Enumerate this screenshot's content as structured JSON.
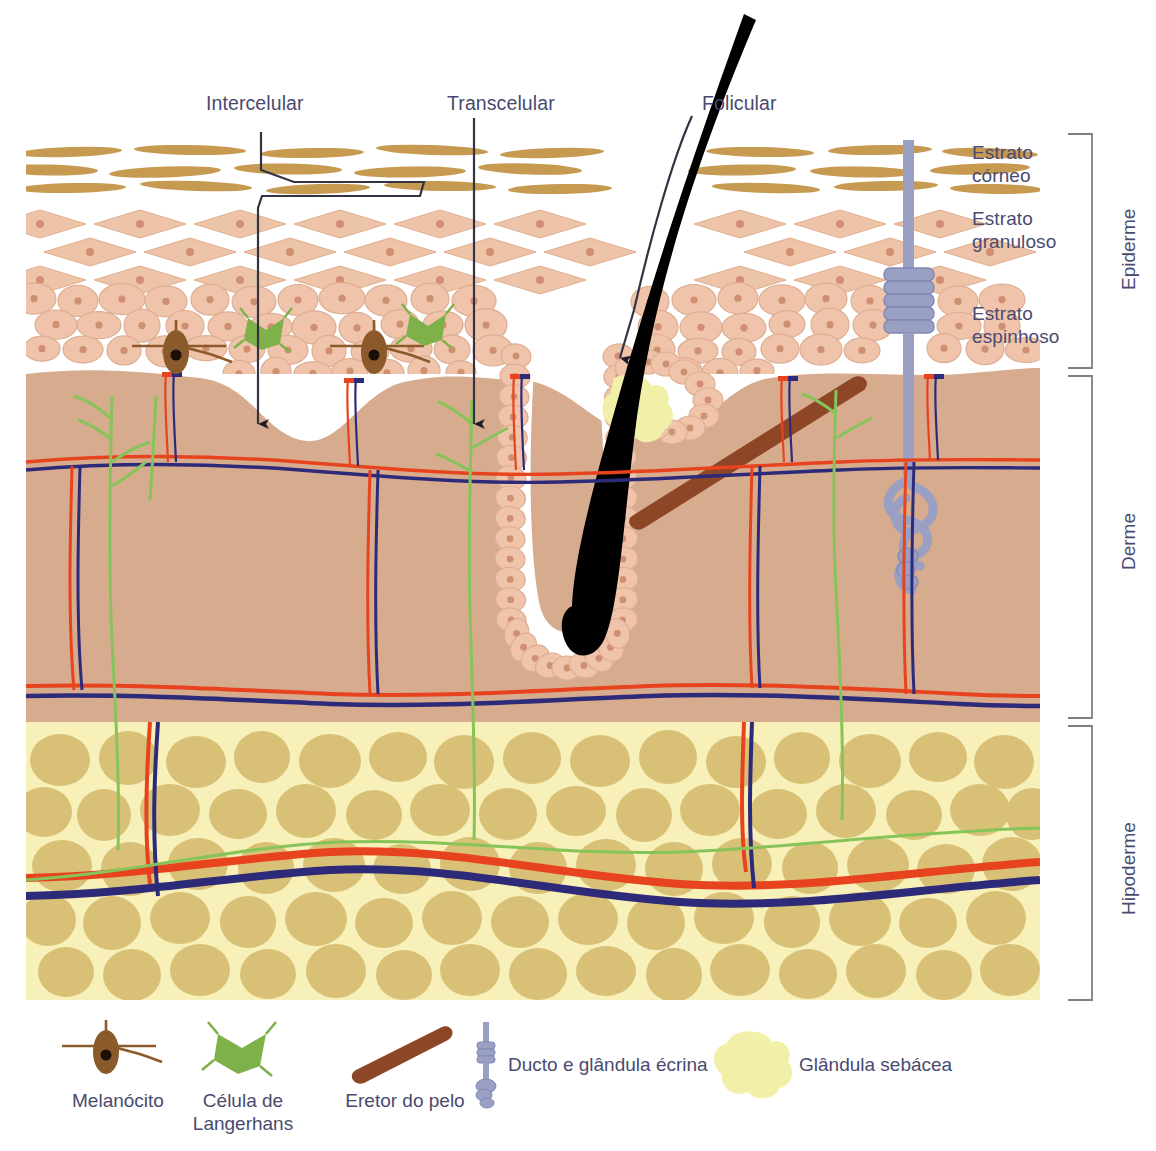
{
  "diagram": {
    "title_routes": [
      {
        "id": "intercellular",
        "label": "Intercelular",
        "x": 206,
        "y": 92
      },
      {
        "id": "transcellular",
        "label": "Transcelular",
        "x": 447,
        "y": 92
      },
      {
        "id": "follicular",
        "label": "Folicular",
        "x": 702,
        "y": 92
      }
    ],
    "epidermis_sublayers": [
      {
        "id": "stratum-corneum",
        "label": "Estrato\ncórneo",
        "x": 972,
        "y": 141
      },
      {
        "id": "stratum-granulosum",
        "label": "Estrato\ngranuloso",
        "x": 972,
        "y": 207
      },
      {
        "id": "stratum-spinosum",
        "label": "Estrato\nespinhoso",
        "x": 972,
        "y": 302
      }
    ],
    "layer_brackets": [
      {
        "id": "epiderme",
        "label": "Epiderme",
        "top": 134,
        "bottom": 368,
        "x": 1100
      },
      {
        "id": "derme",
        "label": "Derme",
        "top": 376,
        "bottom": 718,
        "x": 1100
      },
      {
        "id": "hipoderme",
        "label": "Hipoderme",
        "top": 726,
        "bottom": 1000,
        "x": 1100
      }
    ],
    "legend": [
      {
        "id": "melanocyte",
        "label": "Melanócito",
        "icon": "melanocyte-icon",
        "x": 118,
        "y": 1093
      },
      {
        "id": "langerhans",
        "label": "Célula de\nLangerhans",
        "x": 243,
        "y": 1093,
        "icon": "langerhans-cell-icon"
      },
      {
        "id": "arrector-pili",
        "label": "Eretor do pelo",
        "x": 398,
        "y": 1093,
        "icon": "arrector-pili-icon"
      },
      {
        "id": "eccrine",
        "label": "Ducto e glândula écrina",
        "x": 508,
        "y": 1060,
        "icon": "eccrine-duct-icon"
      },
      {
        "id": "sebaceous",
        "label": "Glândula sebácea",
        "x": 799,
        "y": 1060,
        "icon": "sebaceous-gland-icon"
      }
    ],
    "colors": {
      "text": "#4a4a70",
      "stratum_corneum": "#c69a51",
      "stratum_granulosum": "#eec4a8",
      "stratum_spinosum": "#f0c4ab",
      "cell_nucleus": "#cf8f71",
      "dermis": "#d7ab8e",
      "hypodermis_bg": "#f7f0b8",
      "adipocyte": "#d9c077",
      "artery": "#e8431f",
      "vein": "#2e2a7a",
      "nerve": "#86c45a",
      "hair": "#000000",
      "melanocyte": "#8a5a2b",
      "langerhans": "#7fb14a",
      "arrector_pili": "#8d4626",
      "eccrine_duct": "#9aa0c4",
      "sebaceous": "#f2f0a8",
      "bracket": "#808080",
      "leader": "#333344"
    }
  }
}
